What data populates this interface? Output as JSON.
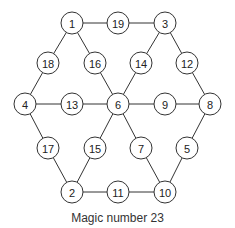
{
  "diagram": {
    "title": "Magic number 23",
    "type": "magic-star-hexagram",
    "magic_number": 23,
    "nodes": [
      {
        "id": "n1",
        "label": "1",
        "x": 72,
        "y": 23
      },
      {
        "id": "n19",
        "label": "19",
        "x": 118,
        "y": 23
      },
      {
        "id": "n3",
        "label": "3",
        "x": 165,
        "y": 23
      },
      {
        "id": "n18",
        "label": "18",
        "x": 48,
        "y": 63
      },
      {
        "id": "n16",
        "label": "16",
        "x": 95,
        "y": 63
      },
      {
        "id": "n14",
        "label": "14",
        "x": 141,
        "y": 63
      },
      {
        "id": "n12",
        "label": "12",
        "x": 187,
        "y": 63
      },
      {
        "id": "n4",
        "label": "4",
        "x": 25,
        "y": 104
      },
      {
        "id": "n13",
        "label": "13",
        "x": 72,
        "y": 104
      },
      {
        "id": "n6",
        "label": "6",
        "x": 118,
        "y": 104
      },
      {
        "id": "n9",
        "label": "9",
        "x": 165,
        "y": 104
      },
      {
        "id": "n8",
        "label": "8",
        "x": 210,
        "y": 104
      },
      {
        "id": "n17",
        "label": "17",
        "x": 48,
        "y": 148
      },
      {
        "id": "n15",
        "label": "15",
        "x": 95,
        "y": 148
      },
      {
        "id": "n7",
        "label": "7",
        "x": 141,
        "y": 148
      },
      {
        "id": "n5",
        "label": "5",
        "x": 187,
        "y": 148
      },
      {
        "id": "n2",
        "label": "2",
        "x": 72,
        "y": 192
      },
      {
        "id": "n11",
        "label": "11",
        "x": 118,
        "y": 192
      },
      {
        "id": "n10",
        "label": "10",
        "x": 165,
        "y": 192
      }
    ],
    "lines": [
      [
        "n1",
        "n19",
        "n3"
      ],
      [
        "n4",
        "n13",
        "n6",
        "n9",
        "n8"
      ],
      [
        "n2",
        "n11",
        "n10"
      ],
      [
        "n1",
        "n18",
        "n4"
      ],
      [
        "n4",
        "n17",
        "n2"
      ],
      [
        "n1",
        "n16",
        "n6",
        "n7",
        "n10"
      ],
      [
        "n3",
        "n14",
        "n6",
        "n15",
        "n2"
      ],
      [
        "n3",
        "n12",
        "n8"
      ],
      [
        "n8",
        "n5",
        "n10"
      ]
    ]
  }
}
